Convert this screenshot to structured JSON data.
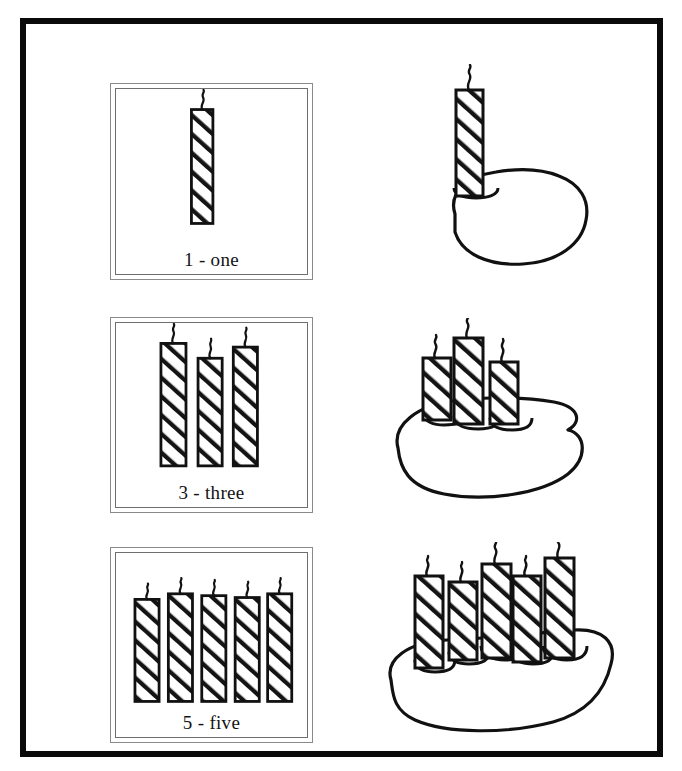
{
  "page": {
    "background_color": "#ffffff",
    "ink_color": "#111111",
    "border_color": "#0a0a0a"
  },
  "panels": [
    {
      "id": "one",
      "label": "1 - one",
      "count": 1,
      "digit": "1",
      "word": "one",
      "candle_x": [
        78
      ],
      "candle_top": [
        22
      ],
      "candle_w": 22,
      "candle_h": 122
    },
    {
      "id": "three",
      "label": "3 - three",
      "count": 3,
      "digit": "3",
      "word": "three",
      "candle_x": [
        45,
        85,
        123
      ],
      "candle_top": [
        22,
        38,
        26
      ],
      "candle_w": 26,
      "candle_h": 130
    },
    {
      "id": "five",
      "label": "5 - five",
      "count": 5,
      "digit": "5",
      "word": "five",
      "candle_x": [
        18,
        54,
        90,
        125,
        160
      ],
      "candle_top": [
        48,
        42,
        44,
        46,
        42
      ],
      "candle_w": 25,
      "candle_h": 108
    }
  ],
  "cakes": [
    {
      "id": "cake-one",
      "candle_count": 1,
      "caption": ""
    },
    {
      "id": "cake-three",
      "candle_count": 3,
      "caption": ""
    },
    {
      "id": "cake-five",
      "candle_count": 5,
      "caption": ""
    }
  ],
  "icons": {
    "candle": "candle-icon",
    "wick": "wick-icon",
    "cake": "cake-icon"
  }
}
